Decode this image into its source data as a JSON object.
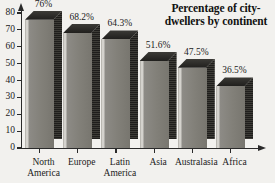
{
  "chart_data": {
    "type": "bar",
    "title_line1": "Percentage of city-",
    "title_line2": "dwellers by continent",
    "categories": [
      "North America",
      "Europe",
      "Latin America",
      "Asia",
      "Australasia",
      "Africa"
    ],
    "category_lines": [
      [
        "North",
        "America"
      ],
      [
        "Europe",
        ""
      ],
      [
        "Latin",
        "America"
      ],
      [
        "Asia",
        ""
      ],
      [
        "Australasia",
        ""
      ],
      [
        "Africa",
        ""
      ]
    ],
    "values": [
      76,
      68.2,
      64.3,
      51.6,
      47.5,
      36.5
    ],
    "data_labels": [
      "76%",
      "68.2%",
      "64.3%",
      "51.6%",
      "47.5%",
      "36.5%"
    ],
    "xlabel": "",
    "ylabel": "",
    "ylim": [
      0,
      80
    ],
    "ytick_values": [
      0,
      10,
      20,
      30,
      40,
      50,
      60,
      70,
      80
    ],
    "ytick_labels": [
      "0",
      "10",
      "20",
      "30",
      "40",
      "50",
      "60",
      "70",
      "80"
    ],
    "grid": false,
    "legend": false,
    "style": "3d-bar",
    "colors": {
      "bar_front": "#828079",
      "bar_top": "#2c2b28",
      "bar_side": "#242320",
      "axis": "#2a2a2a",
      "background": "#f2f1ee",
      "text": "#1b1b1b"
    }
  }
}
